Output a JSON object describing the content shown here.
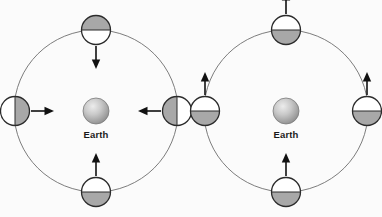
{
  "figure": {
    "background_color": "#fbfbfb",
    "width": 382,
    "height": 217
  },
  "style": {
    "orbit_stroke": "#6e6e6e",
    "orbit_stroke_width": 0.9,
    "moon_outline": "#2b2b2b",
    "moon_outline_width": 1.3,
    "moon_shaded_color": "#a8a8a8",
    "moon_lit_color": "#ffffff",
    "arrow_color": "#111111",
    "arrow_shaft_width": 1.6,
    "earth_color_light": "#e8e8e8",
    "earth_color_mid": "#b4b4b4",
    "earth_color_dark": "#8a8a8a",
    "earth_outline": "#7a7a7a",
    "label_color": "#1a1a1a"
  },
  "panels": [
    {
      "id": "panel-left",
      "name": "synchronous-rotation-panel",
      "center": {
        "x": 96,
        "y": 111
      },
      "orbit_radius_x": 82,
      "orbit_radius_y": 81,
      "earth": {
        "label": "Earth",
        "radius": 13,
        "label_offset_y": 24
      },
      "moons": [
        {
          "id": "left-moon-top",
          "name": "moon-top",
          "position": "top",
          "cx": 96,
          "cy": 30,
          "radius": 14.5,
          "shade_angle_deg": 0,
          "shaded_side": "top",
          "arrow": {
            "direction": "down",
            "dx": 0,
            "dy": 1,
            "start_offset": 16,
            "length": 23
          }
        },
        {
          "id": "left-moon-left",
          "name": "moon-left",
          "position": "left",
          "cx": 15,
          "cy": 111,
          "radius": 14.5,
          "shade_angle_deg": 90,
          "shaded_side": "left",
          "arrow": {
            "direction": "right",
            "dx": 1,
            "dy": 0,
            "start_offset": 16,
            "length": 23
          }
        },
        {
          "id": "left-moon-right",
          "name": "moon-right",
          "position": "right",
          "cx": 177,
          "cy": 111,
          "radius": 14.5,
          "shade_angle_deg": 270,
          "shaded_side": "right",
          "arrow": {
            "direction": "left",
            "dx": -1,
            "dy": 0,
            "start_offset": 16,
            "length": 23
          }
        },
        {
          "id": "left-moon-bottom",
          "name": "moon-bottom",
          "position": "bottom",
          "cx": 96,
          "cy": 192,
          "radius": 14.5,
          "shade_angle_deg": 180,
          "shaded_side": "bottom",
          "arrow": {
            "direction": "up",
            "dx": 0,
            "dy": -1,
            "start_offset": 16,
            "length": 23
          }
        }
      ]
    },
    {
      "id": "panel-right",
      "name": "no-rotation-panel",
      "center": {
        "x": 286,
        "y": 111
      },
      "orbit_radius_x": 82,
      "orbit_radius_y": 81,
      "earth": {
        "label": "Earth",
        "radius": 13,
        "label_offset_y": 24
      },
      "moons": [
        {
          "id": "right-moon-top",
          "name": "moon-top",
          "position": "top",
          "cx": 286,
          "cy": 30,
          "radius": 14.5,
          "shade_angle_deg": 180,
          "shaded_side": "bottom",
          "arrow": {
            "direction": "up",
            "dx": 0,
            "dy": -1,
            "start_offset": 16,
            "length": 23
          }
        },
        {
          "id": "right-moon-left",
          "name": "moon-left",
          "position": "left",
          "cx": 205,
          "cy": 111,
          "radius": 14.5,
          "shade_angle_deg": 180,
          "shaded_side": "bottom",
          "arrow": {
            "direction": "up",
            "dx": 0,
            "dy": -1,
            "start_offset": 16,
            "length": 23
          }
        },
        {
          "id": "right-moon-right",
          "name": "moon-right",
          "position": "right",
          "cx": 367,
          "cy": 111,
          "radius": 14.5,
          "shade_angle_deg": 180,
          "shaded_side": "bottom",
          "arrow": {
            "direction": "up",
            "dx": 0,
            "dy": -1,
            "start_offset": 16,
            "length": 23
          }
        },
        {
          "id": "right-moon-bottom",
          "name": "moon-bottom",
          "position": "bottom",
          "cx": 286,
          "cy": 192,
          "radius": 14.5,
          "shade_angle_deg": 180,
          "shaded_side": "bottom",
          "arrow": {
            "direction": "up",
            "dx": 0,
            "dy": -1,
            "start_offset": 16,
            "length": 23
          }
        }
      ]
    }
  ]
}
